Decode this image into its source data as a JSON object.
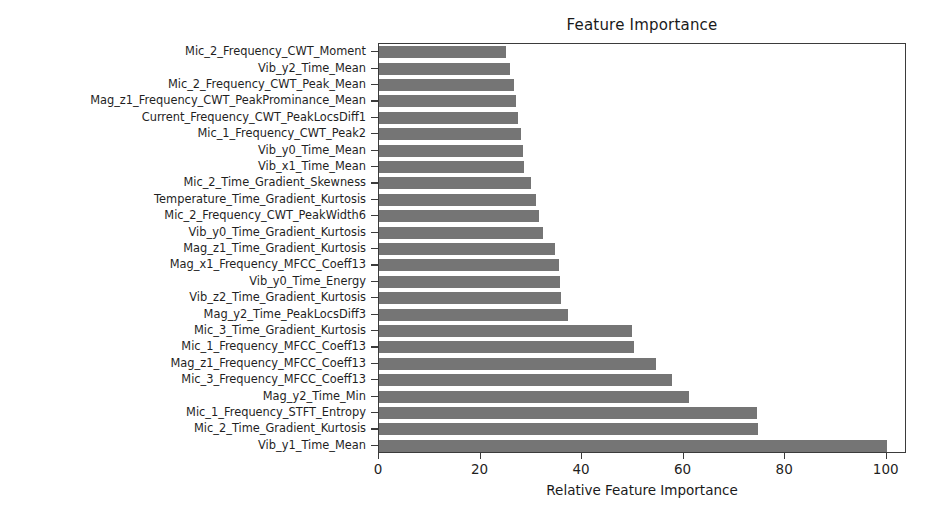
{
  "chart_data": {
    "type": "bar",
    "orientation": "horizontal",
    "title": "Feature Importance",
    "xlabel": "Relative Feature Importance",
    "ylabel": "",
    "xlim": [
      0,
      104
    ],
    "xticks": [
      0,
      20,
      40,
      60,
      80,
      100
    ],
    "grid": false,
    "legend": null,
    "bar_color": "#757575",
    "categories": [
      "Mic_2_Frequency_CWT_Moment",
      "Vib_y2_Time_Mean",
      "Mic_2_Frequency_CWT_Peak_Mean",
      "Mag_z1_Frequency_CWT_PeakProminance_Mean",
      "Current_Frequency_CWT_PeakLocsDiff1",
      "Mic_1_Frequency_CWT_Peak2",
      "Vib_y0_Time_Mean",
      "Vib_x1_Time_Mean",
      "Mic_2_Time_Gradient_Skewness",
      "Temperature_Time_Gradient_Kurtosis",
      "Mic_2_Frequency_CWT_PeakWidth6",
      "Vib_y0_Time_Gradient_Kurtosis",
      "Mag_z1_Time_Gradient_Kurtosis",
      "Mag_x1_Frequency_MFCC_Coeff13",
      "Vib_y0_Time_Energy",
      "Vib_z2_Time_Gradient_Kurtosis",
      "Mag_y2_Time_PeakLocsDiff3",
      "Mic_3_Time_Gradient_Kurtosis",
      "Mic_1_Frequency_MFCC_Coeff13",
      "Mag_z1_Frequency_MFCC_Coeff13",
      "Mic_3_Frequency_MFCC_Coeff13",
      "Mag_y2_Time_Min",
      "Mic_1_Frequency_STFT_Entropy",
      "Mic_2_Time_Gradient_Kurtosis",
      "Vib_y1_Time_Mean"
    ],
    "values": [
      25.0,
      25.8,
      26.5,
      27.0,
      27.4,
      28.0,
      28.3,
      28.6,
      30.0,
      31.0,
      31.6,
      32.3,
      34.6,
      35.4,
      35.6,
      35.8,
      37.3,
      49.8,
      50.2,
      54.5,
      57.7,
      61.0,
      74.5,
      74.6,
      100.0
    ]
  }
}
